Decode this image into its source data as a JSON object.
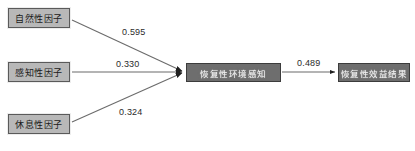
{
  "diagram": {
    "type": "path-model",
    "nodes": [
      {
        "id": "naturalness",
        "label": "自然性因子",
        "style": "light"
      },
      {
        "id": "perception",
        "label": "感知性因子",
        "style": "light"
      },
      {
        "id": "restfulness",
        "label": "休息性因子",
        "style": "light"
      },
      {
        "id": "mediator",
        "label": "恢复性环境感知",
        "style": "dark"
      },
      {
        "id": "outcome",
        "label": "恢复性效益结果",
        "style": "dark"
      }
    ],
    "edges": [
      {
        "from": "naturalness",
        "to": "mediator",
        "coefficient": "0.595"
      },
      {
        "from": "perception",
        "to": "mediator",
        "coefficient": "0.330"
      },
      {
        "from": "restfulness",
        "to": "mediator",
        "coefficient": "0.324"
      },
      {
        "from": "mediator",
        "to": "outcome",
        "coefficient": "0.489"
      }
    ],
    "caption": "",
    "colors": {
      "node_light_fill": "#b8b8b8",
      "node_light_border": "#5a5a5a",
      "node_dark_fill": "#6e6e6e",
      "node_dark_border": "#3c3c3c",
      "edge_stroke": "#6b6b6b",
      "background": "#ffffff",
      "label_text": "#2b2b2b"
    }
  }
}
